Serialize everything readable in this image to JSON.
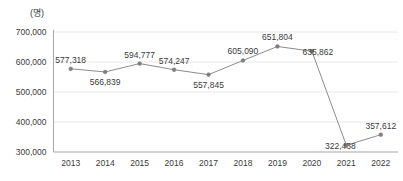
{
  "chart_data": {
    "type": "line",
    "title": "",
    "subtitle": "",
    "xlabel": "",
    "ylabel": "",
    "unit_label": "(명)",
    "categories": [
      "2013",
      "2014",
      "2015",
      "2016",
      "2017",
      "2018",
      "2019",
      "2020",
      "2021",
      "2022"
    ],
    "values": [
      577318,
      566839,
      594777,
      574247,
      557845,
      605090,
      651804,
      635862,
      322438,
      357612
    ],
    "data_labels": [
      "577,318",
      "566,839",
      "594,777",
      "574,247",
      "557,845",
      "605,090",
      "651,804",
      "635,862",
      "322,438",
      "357,612"
    ],
    "label_positions": [
      "above",
      "below",
      "above",
      "above",
      "below",
      "above",
      "above",
      "right",
      "left",
      "above"
    ],
    "ylim": [
      300000,
      700000
    ],
    "yticks": [
      300000,
      400000,
      500000,
      600000,
      700000
    ],
    "ytick_labels": [
      "300,000",
      "400,000",
      "500,000",
      "600,000",
      "700,000"
    ],
    "grid": true,
    "legend": "none",
    "series_color": "#8c8c8c",
    "marker_color": "#7f7f7f",
    "grid_color": "#e8e8e8",
    "axis_color": "#a6a6a6",
    "text_color": "#3a3a3a"
  }
}
